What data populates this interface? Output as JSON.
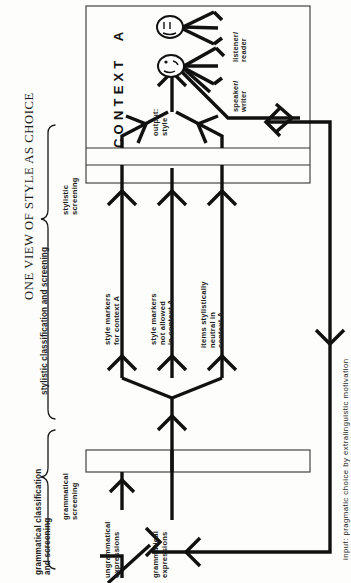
{
  "figure": {
    "title": "ONE VIEW OF STYLE AS CHOICE",
    "orientation": "rotated-90-ccw",
    "braces": [
      {
        "id": "stylistic",
        "label": "stylistic classification and screening"
      },
      {
        "id": "grammatical",
        "label": "grammatical classification\nand screening"
      }
    ],
    "stage_labels": [
      {
        "id": "stylistic-screening",
        "label": "stylistic\nscreening"
      },
      {
        "id": "grammatical-screening",
        "label": "grammatical\nscreening"
      }
    ],
    "context_box": {
      "label": "CONTEXT  A",
      "output_label": "output:\nstyle",
      "actors": [
        {
          "id": "speaker-writer",
          "label": "speaker/\nwriter"
        },
        {
          "id": "listener-reader",
          "label": "listener/\nreader"
        }
      ]
    },
    "channels": [
      {
        "id": "channel-1",
        "label": "style markers\nfor context A",
        "passes_screening": true
      },
      {
        "id": "channel-2",
        "label": "style markers\nnot allowed\nin context A",
        "passes_screening": false
      },
      {
        "id": "channel-3",
        "label": "items stylistically\nneutral in\ncontext A",
        "passes_screening": true
      }
    ],
    "stream_labels": [
      {
        "id": "ungrammatical-expressions",
        "label": "ungrammatical\nexpressions"
      },
      {
        "id": "grammatical-expressions",
        "label": "grammatical\nexpressions"
      }
    ],
    "input": {
      "label": "input: pragmatic choice by extralinguistic motivation"
    },
    "colors": {
      "ink": "#111111",
      "paper": "#fdfdfb",
      "rule": "#333333"
    }
  }
}
